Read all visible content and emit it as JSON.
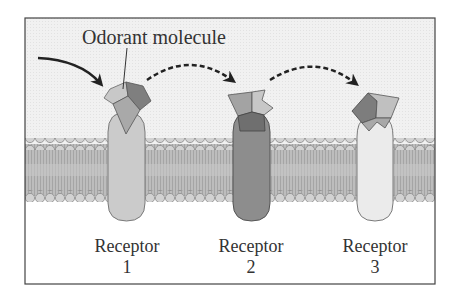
{
  "diagram": {
    "title_label": "Odorant molecule",
    "receptors": [
      {
        "label": "Receptor",
        "number": "1",
        "color": "#c9c9c9"
      },
      {
        "label": "Receptor",
        "number": "2",
        "color": "#8c8c8c"
      },
      {
        "label": "Receptor",
        "number": "3",
        "color": "#e6e6e6"
      }
    ],
    "arrows": [
      {
        "style": "solid",
        "from": "outside",
        "to": "receptor-1"
      },
      {
        "style": "dashed",
        "from": "receptor-1",
        "to": "receptor-2"
      },
      {
        "style": "dashed",
        "from": "receptor-2",
        "to": "receptor-3"
      }
    ],
    "colors": {
      "background_top": "#f2f2f2",
      "membrane": "#b5b5b5",
      "lipid_head": "#cfcfcf",
      "frame": "#444444",
      "molecule_dark": "#7d7d7d",
      "molecule_mid": "#a9a9a9",
      "molecule_light": "#c4c4c4"
    }
  }
}
